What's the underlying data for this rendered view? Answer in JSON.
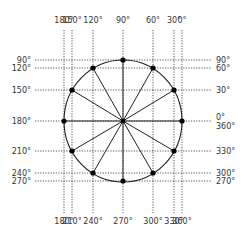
{
  "diagram": {
    "center": {
      "x": 123,
      "y": 121
    },
    "radius_x": 59,
    "radius_y": 61,
    "grid_extent": {
      "left": 35,
      "right": 212,
      "top": 30,
      "bottom": 213
    },
    "points": [
      {
        "angle": 0,
        "x": 182,
        "y": 121
      },
      {
        "angle": 30,
        "x": 174,
        "y": 90
      },
      {
        "angle": 60,
        "x": 153,
        "y": 68
      },
      {
        "angle": 90,
        "x": 123,
        "y": 60
      },
      {
        "angle": 120,
        "x": 93,
        "y": 68
      },
      {
        "angle": 150,
        "x": 72,
        "y": 90
      },
      {
        "angle": 180,
        "x": 64,
        "y": 121
      },
      {
        "angle": 210,
        "x": 72,
        "y": 151
      },
      {
        "angle": 240,
        "x": 93,
        "y": 173
      },
      {
        "angle": 270,
        "x": 123,
        "y": 181
      },
      {
        "angle": 300,
        "x": 153,
        "y": 173
      },
      {
        "angle": 330,
        "x": 174,
        "y": 151
      }
    ],
    "top_labels": [
      {
        "text": "180°",
        "x": 64
      },
      {
        "text": "150°",
        "x": 72
      },
      {
        "text": "120°",
        "x": 93
      },
      {
        "text": "90°",
        "x": 123
      },
      {
        "text": "60°",
        "x": 153
      },
      {
        "text": "30°",
        "x": 174
      },
      {
        "text": "0°",
        "x": 182
      }
    ],
    "bottom_labels": [
      {
        "text": "180°",
        "x": 64
      },
      {
        "text": "210°",
        "x": 72
      },
      {
        "text": "240°",
        "x": 93
      },
      {
        "text": "270°",
        "x": 123
      },
      {
        "text": "300°",
        "x": 153
      },
      {
        "text": "330°",
        "x": 174
      },
      {
        "text": "360°",
        "x": 182
      }
    ],
    "left_labels": [
      {
        "text": "90°",
        "y": 60
      },
      {
        "text": "120°",
        "y": 68
      },
      {
        "text": "150°",
        "y": 90
      },
      {
        "text": "180°",
        "y": 121
      },
      {
        "text": "210°",
        "y": 151
      },
      {
        "text": "240°",
        "y": 173
      },
      {
        "text": "270°",
        "y": 181
      }
    ],
    "right_labels": [
      {
        "text": "90°",
        "y": 60
      },
      {
        "text": "60°",
        "y": 68
      },
      {
        "text": "30°",
        "y": 90
      },
      {
        "text": "0°",
        "y": 117
      },
      {
        "text": "360°",
        "y": 126
      },
      {
        "text": "330°",
        "y": 151
      },
      {
        "text": "300°",
        "y": 173
      },
      {
        "text": "270°",
        "y": 181
      }
    ],
    "colors": {
      "line": "#222222",
      "grid": "#444444",
      "text": "#333333",
      "dot": "#000000"
    }
  }
}
